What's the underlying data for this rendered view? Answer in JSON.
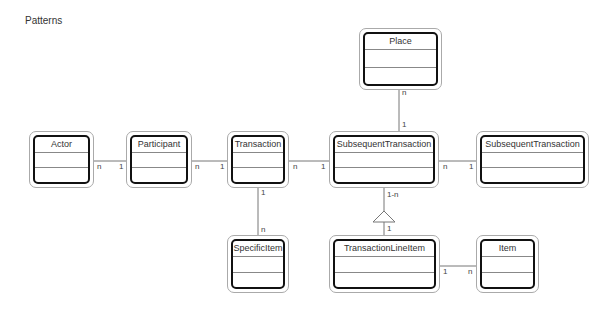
{
  "title": "Patterns",
  "classes": {
    "place": {
      "name": "Place"
    },
    "actor": {
      "name": "Actor"
    },
    "participant": {
      "name": "Participant"
    },
    "transaction": {
      "name": "Transaction"
    },
    "subsequent_transaction": {
      "name": "SubsequentTransaction"
    },
    "subsequent_transaction_right": {
      "name": "SubsequentTransaction"
    },
    "specific_item": {
      "name": "SpecificItem"
    },
    "transaction_line_item": {
      "name": "TransactionLineItem"
    },
    "item": {
      "name": "Item"
    }
  },
  "multiplicities": {
    "actor_participant_a": "n",
    "actor_participant_b": "1",
    "participant_transaction_a": "n",
    "participant_transaction_b": "1",
    "transaction_subseq_a": "n",
    "transaction_subseq_b": "1",
    "subseq_subseq_a": "n",
    "subseq_subseq_b": "1",
    "place_subseq_a": "n",
    "place_subseq_b": "1",
    "transaction_specific_a": "1",
    "transaction_specific_b": "n",
    "subseq_lineitem_a": "1-n",
    "subseq_lineitem_b": "1",
    "lineitem_item_a": "1",
    "lineitem_item_b": "n"
  }
}
